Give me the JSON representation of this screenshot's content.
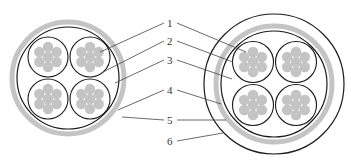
{
  "diagram": {
    "type": "cable-cross-section",
    "colors": {
      "background": "#ffffff",
      "outline": "#1a1a1a",
      "fill_gray": "#c4c4c4",
      "leader": "#444444",
      "label": "#333333"
    },
    "labels": [
      {
        "id": "1",
        "text": "1"
      },
      {
        "id": "2",
        "text": "2"
      },
      {
        "id": "3",
        "text": "3"
      },
      {
        "id": "4",
        "text": "4"
      },
      {
        "id": "5",
        "text": "5"
      },
      {
        "id": "6",
        "text": "6"
      }
    ],
    "left_cable": {
      "pairs": 4,
      "strands_per_conductor": 7
    },
    "right_cable": {
      "pairs": 4,
      "strands_per_conductor": 7,
      "extra_outer_sheath": true
    }
  }
}
